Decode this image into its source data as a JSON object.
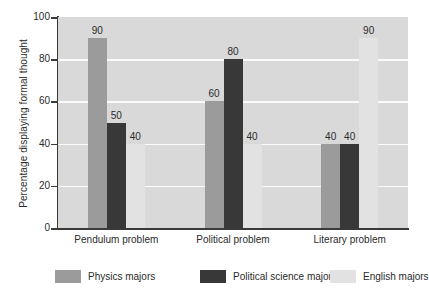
{
  "chart_data": {
    "type": "bar",
    "title": "",
    "subtitle": "",
    "xlabel": "",
    "ylabel": "Percentage displaying formal thought",
    "ylim": [
      0,
      100
    ],
    "yticks": [
      0,
      20,
      40,
      60,
      80,
      100
    ],
    "grid": "horizontal",
    "legend_position": "bottom",
    "categories": [
      "Pendulum problem",
      "Political problem",
      "Literary problem"
    ],
    "series": [
      {
        "name": "Physics majors",
        "color": "#9b9b9b",
        "values": [
          90,
          60,
          40
        ]
      },
      {
        "name": "Political science majors",
        "color": "#383838",
        "values": [
          50,
          80,
          40
        ]
      },
      {
        "name": "English majors",
        "color": "#e2e2e2",
        "values": [
          40,
          40,
          90
        ]
      }
    ],
    "bar_labels": [
      [
        "90",
        "50",
        "40"
      ],
      [
        "60",
        "80",
        "40"
      ],
      [
        "40",
        "40",
        "90"
      ]
    ],
    "plot_background": "#d9d9d9",
    "gridline_color": "#fbfbfb",
    "axis_color": "#3a3a3a"
  },
  "axis": {
    "y_title": "Percentage displaying formal thought",
    "y_tick_labels": [
      "100",
      "80",
      "60",
      "40",
      "20",
      "0"
    ],
    "x_tick_labels": [
      "Pendulum problem",
      "Political problem",
      "Literary problem"
    ]
  },
  "legend": {
    "items": [
      {
        "label": "Physics majors"
      },
      {
        "label": "Political science majors"
      },
      {
        "label": "English majors"
      }
    ]
  }
}
